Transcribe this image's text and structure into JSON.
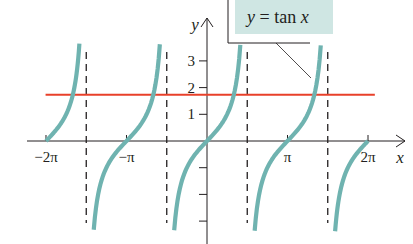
{
  "chart_data": {
    "type": "line",
    "title": "",
    "xlabel": "x",
    "ylabel": "y",
    "xlim": [
      -6.6,
      6.9
    ],
    "ylim": [
      -3.3,
      3.3
    ],
    "grid": false,
    "x_ticks": [
      {
        "value": -6.2832,
        "label": "−2π"
      },
      {
        "value": -3.1416,
        "label": "−π"
      },
      {
        "value": 3.1416,
        "label": "π"
      },
      {
        "value": 6.2832,
        "label": "2π"
      }
    ],
    "y_ticks": [
      {
        "value": 3,
        "label": "3"
      },
      {
        "value": 2,
        "label": "2"
      },
      {
        "value": 1,
        "label": "1"
      },
      {
        "value": -1,
        "label": ""
      },
      {
        "value": -2,
        "label": ""
      },
      {
        "value": -3,
        "label": ""
      }
    ],
    "asymptotes": [
      -4.7124,
      -1.5708,
      1.5708,
      4.7124
    ],
    "series": [
      {
        "name": "y = tan x",
        "function": "tan",
        "color": "#6fb3b0",
        "branches": [
          {
            "x_start": -6.2832,
            "x_end": -4.98
          },
          {
            "x_start": -4.42,
            "x_end": -1.84
          },
          {
            "x_start": -1.28,
            "x_end": 1.3
          },
          {
            "x_start": 1.86,
            "x_end": 4.44
          },
          {
            "x_start": 5.0,
            "x_end": 6.2832
          }
        ]
      },
      {
        "name": "y = √3",
        "function": "constant",
        "value": 1.732,
        "color": "#e8402a",
        "x_start": -6.3,
        "x_end": 6.55
      }
    ],
    "legend": {
      "text_prefix": "y",
      "text_eq": " = tan ",
      "text_var": "x",
      "fill": "#cfe6e3",
      "position": "top-right"
    }
  }
}
